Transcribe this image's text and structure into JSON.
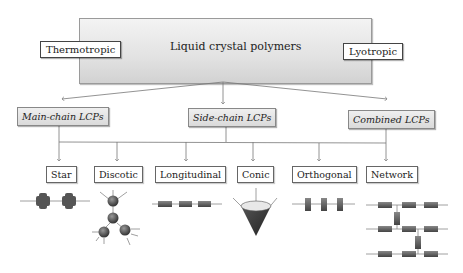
{
  "diagram": {
    "root": {
      "label": "Liquid crystal polymers"
    },
    "side_labels": {
      "left": "Thermotropic",
      "right": "Lyotropic"
    },
    "categories": [
      {
        "label": "Main-chain LCPs"
      },
      {
        "label": "Side-chain LCPs"
      },
      {
        "label": "Combined LCPs"
      }
    ],
    "types": [
      {
        "label": "Star",
        "icon": "star-mesogen-icon"
      },
      {
        "label": "Discotic",
        "icon": "discotic-mesogen-icon"
      },
      {
        "label": "Longitudinal",
        "icon": "longitudinal-mesogen-icon"
      },
      {
        "label": "Conic",
        "icon": "conic-mesogen-icon"
      },
      {
        "label": "Orthogonal",
        "icon": "orthogonal-mesogen-icon"
      },
      {
        "label": "Network",
        "icon": "network-mesogen-icon"
      }
    ],
    "colors": {
      "line": "#777777",
      "mesogen": "#555555",
      "box_border": "#666666"
    }
  }
}
